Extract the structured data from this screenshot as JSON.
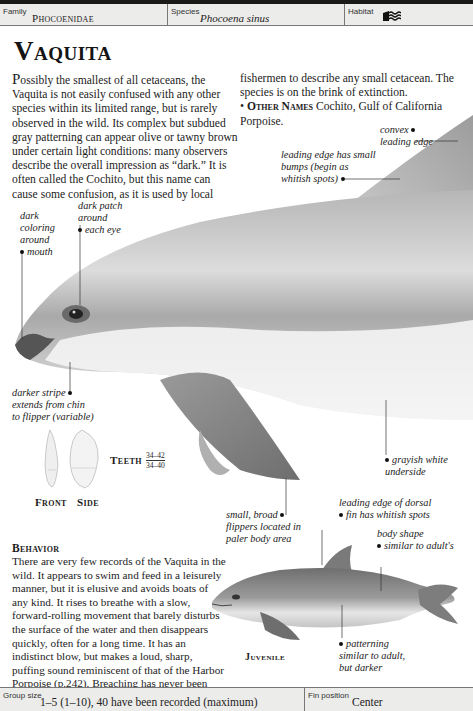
{
  "header": {
    "family_label": "Family",
    "family_value": "Phocoenidae",
    "species_label": "Species",
    "species_value": "Phocoena sinus",
    "habitat_label": "Habitat",
    "habitat_icon": "coastal-water-icon"
  },
  "title": "Vaquita",
  "intro": {
    "dropcap": "P",
    "col1_text": "ossibly the smallest of all cetaceans, the Vaquita is not easily confused with any other species within its limited range, but is rarely observed in the wild. Its complex but subdued gray patterning can appear olive or tawny brown under certain light conditions: many observers describe the overall impression as “dark.” It is often called the Cochito, but this name can cause some confusion, as it is used by local",
    "col2_text": "fishermen to describe any small cetacean. The species is on the brink of extinction.",
    "other_names_bullet": "•",
    "other_names_label": "Other Names",
    "other_names_value": "Cochito, Gulf of California Porpoise."
  },
  "annotations": {
    "convex_edge": [
      "convex",
      "leading edge"
    ],
    "leading_bumps": [
      "leading edge has small",
      "bumps (begin as",
      "whitish spots)"
    ],
    "dark_mouth": [
      "dark",
      "coloring",
      "around",
      "mouth"
    ],
    "eye_patch": [
      "dark patch",
      "around",
      "each eye"
    ],
    "darker_stripe": [
      "darker stripe",
      "extends from chin",
      "to flipper (variable)"
    ],
    "underside": [
      "grayish white",
      "underside"
    ],
    "flippers": [
      "small, broad",
      "flippers located in",
      "paler body area"
    ],
    "dorsal_spots": [
      "leading edge of dorsal",
      "fin has whitish spots"
    ],
    "body_shape": [
      "body shape",
      "similar to adult's"
    ],
    "patterning": [
      "patterning",
      "similar to adult,",
      "but darker"
    ]
  },
  "teeth": {
    "label": "Teeth",
    "upper": "34–42",
    "lower": "34–40",
    "front_label": "Front",
    "side_label": "Side"
  },
  "behavior": {
    "heading": "Behavior",
    "text": "There are very few records of the Vaquita in the wild. It appears to swim and feed in a leisurely manner, but it is elusive and avoids boats of any kind. It rises to breathe with a slow, forward-rolling movement that barely disturbs the surface of the water and then disappears quickly, often for a long time. It has an indistinct blow, but makes a loud, sharp, puffing sound reminiscent of that of the Harbor Porpoise (p.242). Breaching has never been observed."
  },
  "juvenile_label": "Juvenile",
  "footer": {
    "group_size_label": "Group size",
    "group_size_value": "1–5 (1–10), 40 have been recorded (maximum)",
    "fin_position_label": "Fin position",
    "fin_position_value": "Center"
  },
  "colors": {
    "header_bg": "#ececea",
    "rule": "#1a1a1a",
    "body_gray": "#9a9a9a",
    "flipper_gray": "#8a8a8a"
  }
}
